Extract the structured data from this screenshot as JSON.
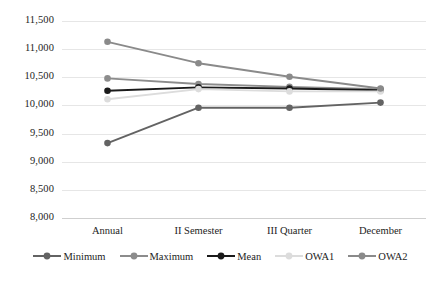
{
  "chart_data": {
    "type": "line",
    "title": "",
    "subtitle": "",
    "xlabel": "",
    "ylabel": "",
    "categories": [
      "Annual",
      "II Semester",
      "III Quarter",
      "December"
    ],
    "ylim": [
      8000,
      11500
    ],
    "y_ticks": [
      "8,000",
      "8,500",
      "9,000",
      "9,500",
      "10,000",
      "10,500",
      "11,000",
      "11,500"
    ],
    "y_tick_values": [
      8000,
      8500,
      9000,
      9500,
      10000,
      10500,
      11000,
      11500
    ],
    "grid": "horizontal",
    "legend_position": "bottom",
    "marker": "circle",
    "series": [
      {
        "name": "Minimum",
        "color": "#636363",
        "values": [
          9330,
          9960,
          9960,
          10050
        ]
      },
      {
        "name": "Maximum",
        "color": "#8c8c8c",
        "values": [
          10480,
          10380,
          10330,
          10290
        ]
      },
      {
        "name": "Mean",
        "color": "#1a1a1a",
        "values": [
          10260,
          10320,
          10300,
          10270
        ]
      },
      {
        "name": "OWA1",
        "color": "#dcdcdc",
        "values": [
          10110,
          10290,
          10250,
          10250
        ]
      },
      {
        "name": "OWA2",
        "color": "#8a8a8a",
        "values": [
          11130,
          10750,
          10510,
          10300
        ]
      }
    ]
  },
  "legend": {
    "items": [
      {
        "label": "Minimum",
        "color": "#636363"
      },
      {
        "label": "Maximum",
        "color": "#8c8c8c"
      },
      {
        "label": "Mean",
        "color": "#1a1a1a"
      },
      {
        "label": "OWA1",
        "color": "#dcdcdc"
      },
      {
        "label": "OWA2",
        "color": "#8a8a8a"
      }
    ]
  },
  "caption": {
    "text": ""
  },
  "colors": {
    "gridline": "#e6e6e6",
    "axis": "#cfcfcf",
    "text": "#1d1d1d",
    "background": "#ffffff"
  }
}
